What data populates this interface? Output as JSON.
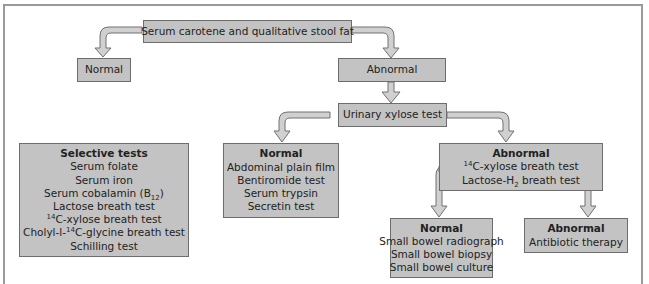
{
  "diagram": {
    "type": "flowchart",
    "colors": {
      "box_fill": "#c3c3c3",
      "box_border": "#6d6d6d",
      "arrow_fill": "#cfcfcf",
      "arrow_stroke": "#707070",
      "frame": "#9a9a9a"
    },
    "nodes": {
      "start": {
        "label": "Serum carotene and qualitative stool fat"
      },
      "top_normal": {
        "label": "Normal"
      },
      "top_abnormal": {
        "label": "Abnormal"
      },
      "xylose": {
        "label": "Urinary xylose test"
      },
      "selective": {
        "title": "Selective tests",
        "items": [
          "Serum folate",
          "Serum iron",
          "Serum cobalamin (B12)",
          "Lactose breath test",
          "14C-xylose breath test",
          "Cholyl-l-14C-glycine breath test",
          "Schilling test"
        ],
        "item_parts": {
          "cobalamin_pre": "Serum cobalamin (B",
          "cobalamin_sub": "12",
          "cobalamin_post": ")",
          "xylose_sup": "14",
          "xylose_post": "C-xylose breath test",
          "cholyl_pre": "Cholyl-l-",
          "cholyl_sup": "14",
          "cholyl_post": "C-glycine breath test"
        }
      },
      "xylose_normal": {
        "title": "Normal",
        "items": [
          "Abdominal plain film",
          "Bentiromide test",
          "Serum trypsin",
          "Secretin test"
        ]
      },
      "xylose_abnormal": {
        "title": "Abnormal",
        "items": [
          "14C-xylose breath test",
          "Lactose-H2 breath test"
        ],
        "item_parts": {
          "xylose_sup": "14",
          "xylose_post": "C-xylose breath test",
          "lactose_pre": "Lactose-H",
          "lactose_sub": "2",
          "lactose_post": " breath test"
        }
      },
      "breath_normal": {
        "title": "Normal",
        "items": [
          "Small bowel radiograph",
          "Small bowel biopsy",
          "Small bowel culture"
        ]
      },
      "breath_abnormal": {
        "title": "Abnormal",
        "items": [
          "Antibiotic therapy"
        ]
      }
    },
    "edges": [
      {
        "from": "start",
        "to": "top_normal"
      },
      {
        "from": "start",
        "to": "top_abnormal"
      },
      {
        "from": "top_abnormal",
        "to": "xylose"
      },
      {
        "from": "xylose",
        "to": "xylose_normal"
      },
      {
        "from": "xylose",
        "to": "xylose_abnormal"
      },
      {
        "from": "xylose_abnormal",
        "to": "breath_normal"
      },
      {
        "from": "xylose_abnormal",
        "to": "breath_abnormal"
      }
    ]
  }
}
